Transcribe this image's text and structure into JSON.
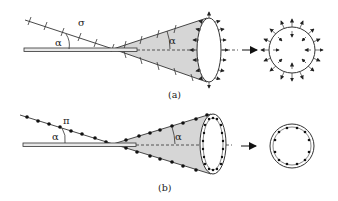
{
  "figure": {
    "panels": [
      {
        "id": "a",
        "caption": "(a)",
        "line_label": "σ",
        "angle_label_left": "α",
        "angle_label_cone": "α",
        "charge_type": "line-tick (surface charge)"
      },
      {
        "id": "b",
        "caption": "(b)",
        "line_label": "π",
        "angle_label_left": "α",
        "angle_label_cone": "α",
        "charge_type": "dot (point charges)"
      }
    ],
    "colors": {
      "stroke": "#333333",
      "cone_fill": "#d6d6d6",
      "rod_fill": "#e8e8e8"
    }
  }
}
